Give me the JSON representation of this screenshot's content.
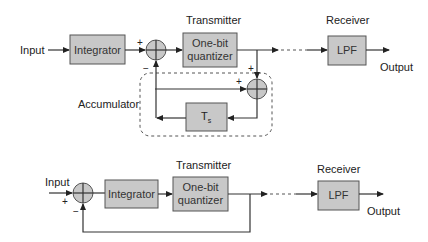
{
  "top_diagram": {
    "input_label": "Input",
    "integrator_label": "Integrator",
    "transmitter_label": "Transmitter",
    "quantizer_line1": "One-bit",
    "quantizer_line2": "quantizer",
    "receiver_label": "Receiver",
    "lpf_label": "LPF",
    "output_label": "Output",
    "accumulator_label": "Accumulator",
    "delay_label": "T",
    "delay_subscript": "s",
    "summer1_plus": "+",
    "summer1_minus": "−",
    "summer2_plus_top": "+",
    "summer2_plus_left": "+"
  },
  "bottom_diagram": {
    "input_label": "Input",
    "integrator_label": "Integrator",
    "transmitter_label": "Transmitter",
    "quantizer_line1": "One-bit",
    "quantizer_line2": "quantizer",
    "receiver_label": "Receiver",
    "lpf_label": "LPF",
    "output_label": "Output",
    "summer_plus": "+",
    "summer_minus": "−"
  },
  "colors": {
    "block_fill": "#c8c8c8",
    "line": "#333333"
  }
}
